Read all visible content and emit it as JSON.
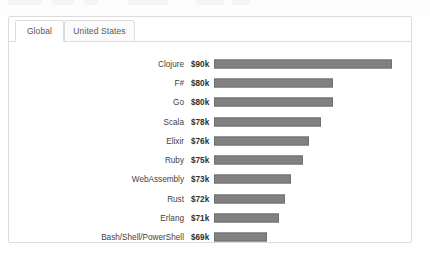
{
  "card": {
    "tabs": [
      {
        "label": "Global",
        "active": true,
        "name": "tab-global"
      },
      {
        "label": "United States",
        "active": false,
        "name": "tab-united-states"
      }
    ]
  },
  "chart_data": {
    "type": "bar",
    "orientation": "horizontal",
    "title": "",
    "subtitle": "",
    "xlabel": "",
    "ylabel": "",
    "grid": false,
    "legend": null,
    "axis_ticks": [],
    "bar_color": "#818181",
    "bar_border_color": "#6f6f6f",
    "value_unit": "USD thousands per year",
    "scale_note": "bar lengths use a non-zero baseline; shortest value $69k still renders a long bar",
    "bar_baseline_value": 60,
    "xlim": [
      60,
      92
    ],
    "categories": [
      "Clojure",
      "F#",
      "Go",
      "Scala",
      "Elixir",
      "Ruby",
      "WebAssembly",
      "Rust",
      "Erlang",
      "Bash/Shell/PowerShell"
    ],
    "values": [
      90,
      80,
      80,
      78,
      76,
      75,
      73,
      72,
      71,
      69
    ],
    "value_labels": [
      "$90k",
      "$80k",
      "$80k",
      "$78k",
      "$76k",
      "$75k",
      "$73k",
      "$72k",
      "$71k",
      "$69k"
    ]
  }
}
